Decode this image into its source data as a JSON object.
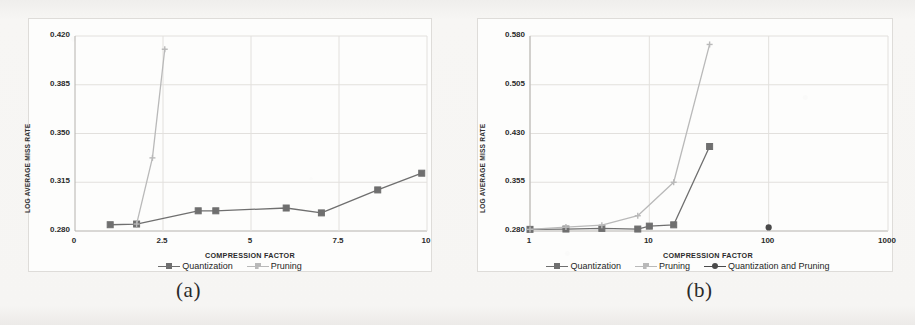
{
  "figure": {
    "background_color": "#f4f3f1",
    "subfigures": [
      {
        "id": "a",
        "caption": "(a)"
      },
      {
        "id": "b",
        "caption": "(b)"
      }
    ]
  },
  "colors": {
    "quantization": "#6f6f6f",
    "pruning": "#b9b9b9",
    "quantization_and_pruning": "#4a4a4a",
    "grid": "#e2e0dd",
    "axis": "#b5b2ae",
    "text": "#2b2b2b"
  },
  "chart_data": [
    {
      "id": "chart-a",
      "type": "line",
      "title": "",
      "xlabel": "COMPRESSION FACTOR",
      "ylabel": "LOG AVERAGE MISS RATE",
      "xscale": "linear",
      "yscale": "linear",
      "xlim": [
        0,
        10
      ],
      "ylim": [
        0.28,
        0.42
      ],
      "xticks": [
        "0",
        "2.5",
        "5",
        "7.5",
        "10"
      ],
      "xtick_values": [
        0,
        2.5,
        5,
        7.5,
        10
      ],
      "yticks": [
        "0.280",
        "0.315",
        "0.350",
        "0.385",
        "0.420"
      ],
      "ytick_values": [
        0.28,
        0.315,
        0.35,
        0.385,
        0.42
      ],
      "grid": true,
      "legend_position": "bottom",
      "series": [
        {
          "name": "Quantization",
          "color": "#6f6f6f",
          "marker": "square",
          "x": [
            1.0,
            1.75,
            3.5,
            4.0,
            6.0,
            7.0,
            8.6,
            9.85
          ],
          "y": [
            0.2845,
            0.285,
            0.2945,
            0.2945,
            0.2965,
            0.293,
            0.3095,
            0.3215
          ]
        },
        {
          "name": "Pruning",
          "color": "#b9b9b9",
          "marker": "plus",
          "x": [
            1.75,
            2.2,
            2.55
          ],
          "y": [
            0.285,
            0.3325,
            0.4105
          ]
        }
      ]
    },
    {
      "id": "chart-b",
      "type": "line",
      "title": "",
      "xlabel": "COMPRESSION FACTOR",
      "ylabel": "LOG AVERAGE MISS RATE",
      "xscale": "log",
      "yscale": "linear",
      "xlim": [
        1,
        1000
      ],
      "ylim": [
        0.28,
        0.58
      ],
      "xticks": [
        "1",
        "10",
        "100",
        "1000"
      ],
      "xtick_values": [
        1,
        10,
        100,
        1000
      ],
      "yticks": [
        "0.280",
        "0.355",
        "0.430",
        "0.505",
        "0.580"
      ],
      "ytick_values": [
        0.28,
        0.355,
        0.43,
        0.505,
        0.58
      ],
      "grid": true,
      "legend_position": "bottom",
      "series": [
        {
          "name": "Quantization",
          "color": "#6f6f6f",
          "marker": "square",
          "x": [
            1,
            2,
            4,
            8,
            10,
            16,
            32
          ],
          "y": [
            0.2825,
            0.283,
            0.284,
            0.283,
            0.2875,
            0.2895,
            0.41
          ]
        },
        {
          "name": "Pruning",
          "color": "#b9b9b9",
          "marker": "plus",
          "x": [
            1,
            2,
            4,
            8,
            16,
            32
          ],
          "y": [
            0.2825,
            0.286,
            0.289,
            0.3035,
            0.355,
            0.567
          ]
        },
        {
          "name": "Quantization and Pruning",
          "color": "#4a4a4a",
          "marker": "circle",
          "x": [
            100
          ],
          "y": [
            0.2855
          ]
        }
      ]
    }
  ]
}
